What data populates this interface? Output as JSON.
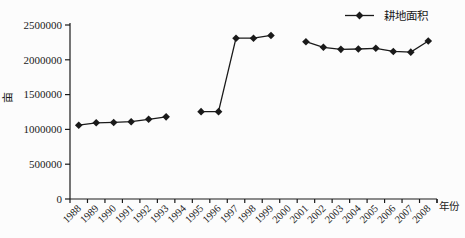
{
  "chart_data": {
    "type": "line",
    "title": "",
    "xlabel": "年份",
    "ylabel": "亩",
    "legend_position": "top-right",
    "grid": false,
    "marker": "diamond",
    "line_color": "#1a1a1a",
    "axis_color": "#1a1a1a",
    "background_color": "#fcfcfc",
    "ylim": [
      0,
      2500000
    ],
    "y_tick_step": 500000,
    "y_tick_labels": [
      "0",
      "500000",
      "1000000",
      "1500000",
      "2000000",
      "2500000"
    ],
    "categories": [
      "1988",
      "1989",
      "1990",
      "1991",
      "1992",
      "1993",
      "1994",
      "1995",
      "1996",
      "1997",
      "1998",
      "1999",
      "2000",
      "2001",
      "2002",
      "2003",
      "2004",
      "2005",
      "2006",
      "2007",
      "2008"
    ],
    "series": [
      {
        "name": "耕地面积",
        "values": [
          1060000,
          1095000,
          1100000,
          1110000,
          1145000,
          1180000,
          null,
          1255000,
          1255000,
          2310000,
          2310000,
          2350000,
          null,
          2260000,
          2180000,
          2150000,
          2155000,
          2165000,
          2120000,
          2110000,
          2270000
        ]
      }
    ]
  }
}
